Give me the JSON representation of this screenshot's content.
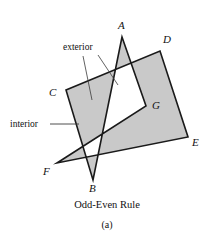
{
  "figure": {
    "caption": "Odd-Even Rule",
    "sub_caption": "(a)",
    "fill_color": "#c9c9c9",
    "stroke_color": "#1a1a1a",
    "background_color": "#ffffff",
    "leader_color": "#3a3a3a",
    "vertices": [
      {
        "id": "A",
        "label": "A",
        "label_x": 118,
        "label_y": 20,
        "point_x": 122,
        "point_y": 37
      },
      {
        "id": "B",
        "label": "B",
        "label_x": 89,
        "label_y": 183,
        "point_x": 93,
        "point_y": 180
      },
      {
        "id": "C",
        "label": "C",
        "label_x": 49,
        "label_y": 87,
        "point_x": 66,
        "point_y": 90
      },
      {
        "id": "D",
        "label": "D",
        "label_x": 163,
        "label_y": 34,
        "point_x": 160,
        "point_y": 51
      },
      {
        "id": "E",
        "label": "E",
        "label_x": 192,
        "label_y": 137,
        "point_x": 188,
        "point_y": 137
      },
      {
        "id": "F",
        "label": "F",
        "label_x": 43,
        "label_y": 166,
        "point_x": 57,
        "point_y": 163
      },
      {
        "id": "G",
        "label": "G",
        "label_x": 152,
        "label_y": 100,
        "point_x": 146,
        "point_y": 106
      }
    ],
    "polygon_path": "122,37 93,180 66,90 160,51 188,137 57,163 146,106",
    "annotations": [
      {
        "id": "exterior",
        "label": "exterior",
        "label_x": 63,
        "label_y": 42,
        "leaders": [
          {
            "x1": 83,
            "y1": 56,
            "x2": 92,
            "y2": 100
          },
          {
            "x1": 98,
            "y1": 55,
            "x2": 118,
            "y2": 85
          }
        ]
      },
      {
        "id": "interior",
        "label": "interior",
        "label_x": 10,
        "label_y": 119,
        "leaders": [
          {
            "x1": 50,
            "y1": 124,
            "x2": 79,
            "y2": 124
          }
        ]
      }
    ]
  }
}
